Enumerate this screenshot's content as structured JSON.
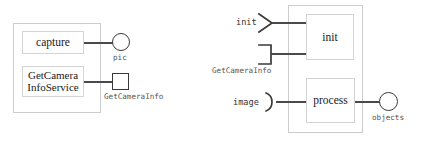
{
  "diagram": {
    "colors": {
      "stroke": "#3a3a3a",
      "wire": "#4a4a4a",
      "box_border": "#d4d4d4",
      "container_border": "#cccccc",
      "text": "#1a1a1a",
      "label_text": "#555555",
      "background": "#ffffff"
    },
    "left_group": {
      "name": "capture-component-group",
      "components": [
        {
          "id": "capture",
          "label": "capture"
        },
        {
          "id": "getcamerainfoservice",
          "label": "GetCamera\nInfoService"
        }
      ],
      "ports": [
        {
          "id": "pic",
          "label": "pic",
          "shape": "circle"
        },
        {
          "id": "getcamerainfo",
          "label": "GetCameraInfo",
          "shape": "square"
        }
      ]
    },
    "right_group": {
      "name": "process-component-group",
      "components": [
        {
          "id": "init",
          "label": "init"
        },
        {
          "id": "process",
          "label": "process"
        }
      ],
      "input_ports": [
        {
          "id": "init-in",
          "label": "init",
          "shape": "chevron"
        },
        {
          "id": "getcamerainfo-in",
          "label": "GetCameraInfo",
          "shape": "bracket"
        },
        {
          "id": "image-in",
          "label": "image",
          "shape": "socket"
        }
      ],
      "output_ports": [
        {
          "id": "objects-out",
          "label": "objects",
          "shape": "circle"
        }
      ]
    }
  }
}
